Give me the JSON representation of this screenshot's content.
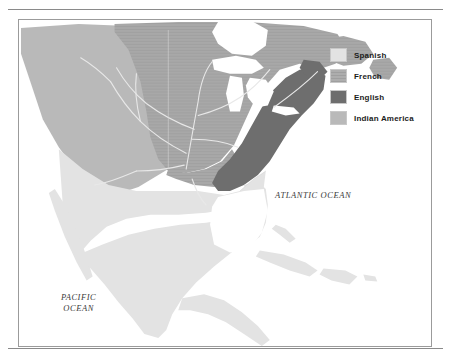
{
  "map": {
    "title": "Colonial claims in North America",
    "frame": {
      "border_color": "#9b9b9b",
      "background": "#ffffff"
    },
    "rules": {
      "color": "#8a8a8a",
      "top": true,
      "bottom": true
    },
    "ocean_labels": [
      {
        "name": "atlantic-ocean-label",
        "text": "ATLANTIC OCEAN"
      },
      {
        "name": "pacific-ocean-label",
        "text": "PACIFIC\nOCEAN"
      }
    ],
    "regions": [
      {
        "key": "spanish",
        "label": "Spanish",
        "color": "#e3e3e3",
        "extent": "Mexico, Baja California, Florida, Cuba, Hispaniola, Caribbean islands, Central America"
      },
      {
        "key": "french",
        "label": "French",
        "color": "#a8a8a8",
        "extent": "Louisiana, Mississippi and Missouri basins, Great Lakes, Canada interior",
        "texture": "fine horizontal hatch"
      },
      {
        "key": "english",
        "label": "English",
        "color": "#6e6e6e",
        "extent": "Atlantic seaboard colonies from Maine to Georgia"
      },
      {
        "key": "indian_america",
        "label": "Indian America",
        "color": "#b9b9b9",
        "extent": "Pacific Northwest, Great Basin, western interior"
      }
    ],
    "water": {
      "color": "#ffffff",
      "features": [
        "Great Lakes",
        "Hudson Bay",
        "Gulf of Mexico",
        "Atlantic Ocean",
        "Pacific Ocean"
      ]
    },
    "rivers": {
      "color": "#e8e8e8",
      "features": [
        "Mississippi River",
        "Missouri River",
        "Ohio River",
        "St. Lawrence River",
        "Rio Grande",
        "Arkansas River",
        "Red River"
      ]
    }
  },
  "legend": {
    "name": "map-legend",
    "items": [
      {
        "label": "Spanish",
        "color": "#e3e3e3"
      },
      {
        "label": "French",
        "color": "#a8a8a8"
      },
      {
        "label": "English",
        "color": "#6e6e6e"
      },
      {
        "label": "Indian America",
        "color": "#b9b9b9"
      }
    ]
  }
}
